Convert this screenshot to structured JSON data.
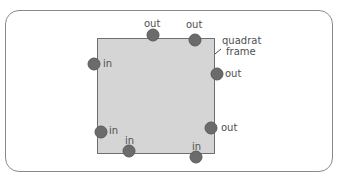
{
  "diagram": {
    "frame_label_line1": "quadrat",
    "frame_label_line2": "frame",
    "colors": {
      "quadrat_fill": "#d5d5d5",
      "dot": "#6b6b6b",
      "border": "#8a8a8a",
      "text": "#505050"
    },
    "dots": [
      {
        "id": "top-1",
        "label": "out",
        "x": 153,
        "y": 35
      },
      {
        "id": "top-2",
        "label": "out",
        "x": 195,
        "y": 40
      },
      {
        "id": "left-upper",
        "label": "in",
        "x": 94,
        "y": 64
      },
      {
        "id": "right-upper",
        "label": "out",
        "x": 217,
        "y": 74
      },
      {
        "id": "left-lower",
        "label": "in",
        "x": 101,
        "y": 132
      },
      {
        "id": "right-lower",
        "label": "out",
        "x": 211,
        "y": 128
      },
      {
        "id": "bottom-1",
        "label": "in",
        "x": 129,
        "y": 151
      },
      {
        "id": "bottom-2",
        "label": "in",
        "x": 196,
        "y": 157
      }
    ]
  }
}
